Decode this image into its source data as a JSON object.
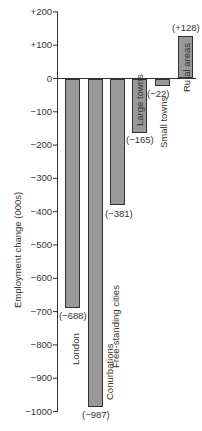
{
  "chart_data": {
    "type": "bar",
    "title": "",
    "xlabel": "",
    "ylabel": "Employment change (000s)",
    "ylim": [
      -1000,
      200
    ],
    "yticks": [
      "+200",
      "+100",
      "0",
      "−100",
      "−200",
      "−300",
      "−400",
      "−500",
      "−600",
      "−700",
      "−800",
      "−900",
      "−1000"
    ],
    "ytick_values": [
      200,
      100,
      0,
      -100,
      -200,
      -300,
      -400,
      -500,
      -600,
      -700,
      -800,
      -900,
      -1000
    ],
    "grid": false,
    "categories": [
      "London",
      "Conurbations",
      "Free-standing cities",
      "Large towns",
      "Small towns",
      "Rural areas"
    ],
    "values": [
      -688,
      -987,
      -381,
      -165,
      -22,
      128
    ],
    "value_labels": [
      "(−688)",
      "(−987)",
      "(−381)",
      "(−165)",
      "(−22)",
      "(+128)"
    ],
    "bar_color": "#999999"
  }
}
